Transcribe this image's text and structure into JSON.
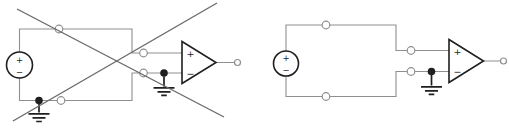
{
  "colors": {
    "background": "#ffffff",
    "wire": "#8f8f8f",
    "component": "#1f1f1f",
    "cross": "#6a6a6a"
  },
  "left_circuit": {
    "crossed_out": true,
    "source": {
      "plus_label": "+",
      "minus_label": "−"
    },
    "opamp": {
      "noninverting_label": "+",
      "inverting_label": "−"
    }
  },
  "right_circuit": {
    "crossed_out": false,
    "source": {
      "plus_label": "+",
      "minus_label": "−"
    },
    "opamp": {
      "noninverting_label": "+",
      "inverting_label": "−"
    }
  }
}
